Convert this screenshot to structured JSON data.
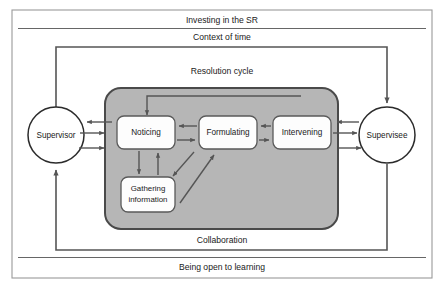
{
  "diagram": {
    "title_labels": {
      "investing": "Investing in the SR",
      "context_of_time": "Context of time",
      "resolution_cycle": "Resolution cycle",
      "collaboration": "Collaboration",
      "being_open": "Being open to learning"
    },
    "actors": [
      {
        "id": "supervisor",
        "label": "Supervisor"
      },
      {
        "id": "supervisee",
        "label": "Supervisee"
      }
    ],
    "cycle_nodes": [
      {
        "id": "noticing",
        "label": "Noticing"
      },
      {
        "id": "formulating",
        "label": "Formulating"
      },
      {
        "id": "intervening",
        "label": "Intervening"
      },
      {
        "id": "gathering",
        "label_line1": "Gathering",
        "label_line2": "information"
      }
    ],
    "colors": {
      "cycle_fill": "#b6b6b6",
      "cycle_stroke": "#4a4a4a",
      "node_fill": "#fdfdfd",
      "node_stroke": "#5a5a5a",
      "arrow": "#555555",
      "outer_border": "#9a9a9a",
      "text": "#1a1a1a",
      "band_line": "#666666",
      "background": "#ffffff"
    }
  }
}
